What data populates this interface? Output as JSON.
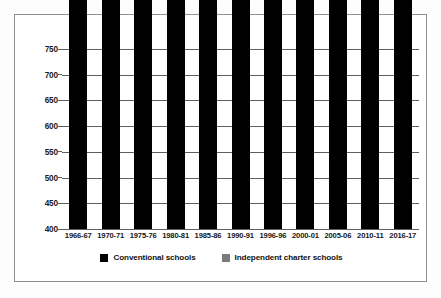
{
  "chart_data": {
    "type": "bar",
    "subtype": "stacked-bar",
    "title": "",
    "xlabel": "",
    "ylabel": "Student enrollment in thousands",
    "ylim": [
      400,
      750
    ],
    "yticks": [
      400,
      450,
      500,
      550,
      600,
      650,
      700,
      750
    ],
    "grid": true,
    "legend_position": "bottom",
    "categories": [
      "1966-67",
      "1970-71",
      "1975-76",
      "1980-81",
      "1985-86",
      "1990-91",
      "1996-96",
      "2000-01",
      "2005-06",
      "2010-11",
      "2016-17"
    ],
    "series": [
      {
        "name": "Conventional schools",
        "color": "#000000",
        "values": [
          623,
          651,
          596,
          550,
          554,
          592,
          665,
          690,
          701,
          597,
          521
        ]
      },
      {
        "name": "Independent charter schools",
        "color": "#7b7b7b",
        "values": [
          0,
          0,
          0,
          0,
          0,
          0,
          13,
          26,
          29,
          88,
          104
        ]
      }
    ],
    "totals": [
      623,
      651,
      596,
      550,
      554,
      592,
      678,
      716,
      730,
      685,
      625
    ]
  },
  "legend": {
    "items": [
      {
        "label": "Conventional schools",
        "color": "#000000"
      },
      {
        "label": "Independent charter schools",
        "color": "#7b7b7b"
      }
    ]
  },
  "axes": {
    "y_title": "Student enrollment in thousands",
    "y_tick_labels": [
      "750",
      "700",
      "650",
      "600",
      "550",
      "500",
      "450",
      "400"
    ],
    "x_tick_labels": [
      "1966-67",
      "1970-71",
      "1975-76",
      "1980-81",
      "1985-86",
      "1990-91",
      "1996-96",
      "2000-01",
      "2005-06",
      "2010-11",
      "2016-17"
    ]
  },
  "colors": {
    "frame_border": "#8d9196",
    "gridline": "#5c5f63",
    "conventional": "#000000",
    "charter": "#7b7b7b",
    "text": "#141414",
    "background": "#ffffff"
  }
}
